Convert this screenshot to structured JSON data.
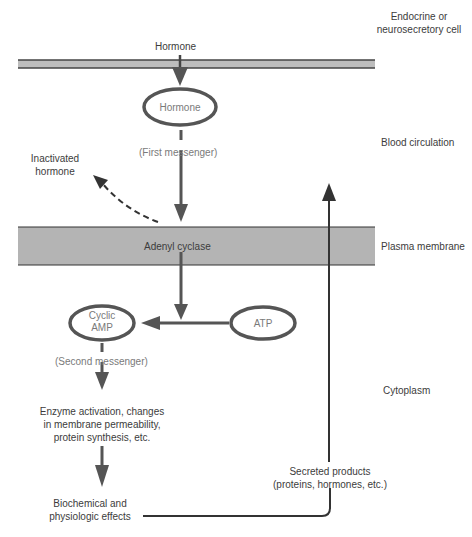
{
  "diagram": {
    "colors": {
      "membrane_fill": "#b4b4b4",
      "line": "#4a4a4a",
      "arrow": "#555555",
      "text": "#3c3c3c",
      "ellipse_text": "#808080"
    },
    "regions": {
      "cell": [
        "Endocrine or",
        "neurosecretory cell"
      ],
      "blood": "Blood circulation",
      "membrane": "Plasma membrane",
      "cytoplasm": "Cytoplasm"
    },
    "nodes": {
      "hormone_top": "Hormone",
      "hormone_ellipse": "Hormone",
      "first_messenger": "(First messenger)",
      "inactivated": [
        "Inactivated",
        "hormone"
      ],
      "adenyl_cyclase": "Adenyl cyclase",
      "cyclic_amp": [
        "Cyclic",
        "AMP"
      ],
      "atp": "ATP",
      "second_messenger": "(Second messenger)",
      "enzyme": [
        "Enzyme activation, changes",
        "in membrane permeability,",
        "protein synthesis, etc."
      ],
      "effects": [
        "Biochemical and",
        "physiologic effects"
      ],
      "secreted": [
        "Secreted products",
        "(proteins, hormones, etc.)"
      ]
    }
  }
}
